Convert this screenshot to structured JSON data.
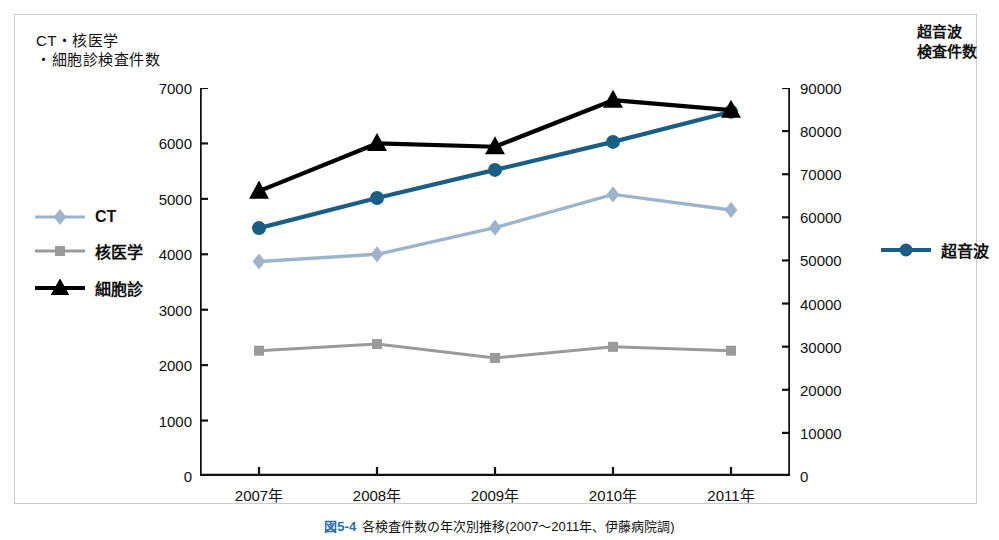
{
  "figure": {
    "caption_number": "図5-4",
    "caption_text": "各検査件数の年次別推移(2007〜2011年、伊藤病院調)"
  },
  "axes": {
    "left_title": "CT・核医学\n・細胞診検査件数",
    "right_title": "超音波\n検査件数",
    "left_ticks": [
      "7000",
      "6000",
      "5000",
      "4000",
      "3000",
      "2000",
      "1000",
      "0"
    ],
    "right_ticks": [
      "90000",
      "80000",
      "70000",
      "60000",
      "50000",
      "40000",
      "30000",
      "20000",
      "10000",
      "0"
    ],
    "x_ticks": [
      "2007年",
      "2008年",
      "2009年",
      "2010年",
      "2011年"
    ]
  },
  "legend_left": [
    {
      "label": "CT",
      "marker": "diamond-icon",
      "color": "#9db4cc"
    },
    {
      "label": "核医学",
      "marker": "square-icon",
      "color": "#9a9a9a"
    },
    {
      "label": "細胞診",
      "marker": "triangle-icon",
      "color": "#000000"
    }
  ],
  "legend_right": [
    {
      "label": "超音波",
      "marker": "circle-icon",
      "color": "#1b5e85"
    }
  ],
  "chart_data": {
    "type": "line",
    "title": "各検査件数の年次別推移(2007〜2011年、伊藤病院調)",
    "xlabel": "",
    "ylabel": "CT・核医学・細胞診検査件数",
    "y2label": "超音波検査件数",
    "categories": [
      "2007年",
      "2008年",
      "2009年",
      "2010年",
      "2011年"
    ],
    "ylim": [
      0,
      7000
    ],
    "y2lim": [
      0,
      90000
    ],
    "ytick_step": 1000,
    "y2tick_step": 10000,
    "grid": false,
    "legend_position": "left-middle and right-middle",
    "series": [
      {
        "name": "CT",
        "axis": "left",
        "marker": "diamond",
        "color": "#9db4cc",
        "values": [
          3870,
          4000,
          4480,
          5080,
          4800
        ]
      },
      {
        "name": "核医学",
        "axis": "left",
        "marker": "square",
        "color": "#9a9a9a",
        "values": [
          2260,
          2380,
          2130,
          2330,
          2260
        ]
      },
      {
        "name": "細胞診",
        "axis": "left",
        "marker": "triangle",
        "color": "#000000",
        "values": [
          5140,
          6000,
          5940,
          6780,
          6600
        ]
      },
      {
        "name": "超音波",
        "axis": "right",
        "marker": "circle",
        "color": "#1b5e85",
        "values": [
          57500,
          64500,
          71000,
          77500,
          84500
        ]
      }
    ]
  }
}
